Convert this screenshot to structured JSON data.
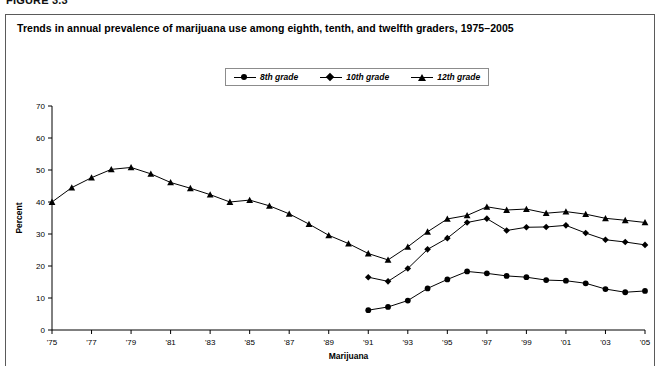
{
  "figure": {
    "number_label": "FIGURE 3.3",
    "title": "Trends in annual prevalence of marijuana use among eighth, tenth, and twelfth graders, 1975–2005"
  },
  "legend": {
    "items": [
      {
        "label": "8th grade",
        "marker": "circle-marker",
        "color": "#000000"
      },
      {
        "label": "10th grade",
        "marker": "diamond-marker",
        "color": "#000000"
      },
      {
        "label": "12th grade",
        "marker": "triangle-marker",
        "color": "#000000"
      }
    ]
  },
  "axes": {
    "y_title": "Percent",
    "x_title": "Marijuana",
    "y_ticks": [
      "0",
      "10",
      "20",
      "30",
      "40",
      "50",
      "60",
      "70"
    ],
    "x_ticks": [
      "'75",
      "'77",
      "'79",
      "'81",
      "'83",
      "'85",
      "'87",
      "'89",
      "'91",
      "'93",
      "'95",
      "'97",
      "'99",
      "'01",
      "'03",
      "'05"
    ]
  },
  "chart_data": {
    "type": "line",
    "title": "Trends in annual prevalence of marijuana use among eighth, tenth, and twelfth graders, 1975–2005",
    "xlabel": "Marijuana",
    "ylabel": "Percent",
    "ylim": [
      0,
      70
    ],
    "xlim": [
      1975,
      2005
    ],
    "grid": false,
    "legend_position": "top-center",
    "x": [
      1975,
      1976,
      1977,
      1978,
      1979,
      1980,
      1981,
      1982,
      1983,
      1984,
      1985,
      1986,
      1987,
      1988,
      1989,
      1990,
      1991,
      1992,
      1993,
      1994,
      1995,
      1996,
      1997,
      1998,
      1999,
      2000,
      2001,
      2002,
      2003,
      2004,
      2005
    ],
    "series": [
      {
        "name": "8th grade",
        "marker": "circle-marker",
        "color": "#000000",
        "x": [
          1991,
          1992,
          1993,
          1994,
          1995,
          1996,
          1997,
          1998,
          1999,
          2000,
          2001,
          2002,
          2003,
          2004,
          2005
        ],
        "values": [
          6.2,
          7.2,
          9.2,
          13.0,
          15.8,
          18.3,
          17.7,
          16.9,
          16.5,
          15.6,
          15.4,
          14.6,
          12.8,
          11.8,
          12.2
        ]
      },
      {
        "name": "10th grade",
        "marker": "diamond-marker",
        "color": "#000000",
        "x": [
          1991,
          1992,
          1993,
          1994,
          1995,
          1996,
          1997,
          1998,
          1999,
          2000,
          2001,
          2002,
          2003,
          2004,
          2005
        ],
        "values": [
          16.5,
          15.2,
          19.2,
          25.2,
          28.7,
          33.6,
          34.8,
          31.1,
          32.1,
          32.2,
          32.7,
          30.3,
          28.2,
          27.5,
          26.6
        ]
      },
      {
        "name": "12th grade",
        "marker": "triangle-marker",
        "color": "#000000",
        "x": [
          1975,
          1976,
          1977,
          1978,
          1979,
          1980,
          1981,
          1982,
          1983,
          1984,
          1985,
          1986,
          1987,
          1988,
          1989,
          1990,
          1991,
          1992,
          1993,
          1994,
          1995,
          1996,
          1997,
          1998,
          1999,
          2000,
          2001,
          2002,
          2003,
          2004,
          2005
        ],
        "values": [
          40.0,
          44.5,
          47.6,
          50.2,
          50.8,
          48.8,
          46.1,
          44.3,
          42.3,
          40.0,
          40.6,
          38.8,
          36.3,
          33.1,
          29.6,
          27.0,
          23.9,
          21.9,
          26.0,
          30.7,
          34.7,
          35.8,
          38.5,
          37.5,
          37.8,
          36.5,
          37.0,
          36.2,
          34.9,
          34.3,
          33.6
        ]
      }
    ]
  },
  "geometry": {
    "plot_left": 52,
    "plot_right": 645,
    "plot_top": 106,
    "plot_bottom": 330
  }
}
